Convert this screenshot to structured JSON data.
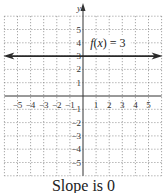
{
  "chart_data": {
    "type": "line",
    "title": "",
    "function_label": "f(x) = 3",
    "xlabel": "",
    "ylabel": "y",
    "xlim": [
      -6,
      6
    ],
    "ylim": [
      -6,
      6
    ],
    "x_ticks": [
      "-5",
      "-4",
      "-3",
      "-2",
      "-1",
      "1",
      "2",
      "3",
      "4",
      "5"
    ],
    "y_ticks": [
      "5",
      "4",
      "3",
      "2",
      "1",
      "-1",
      "-2",
      "-3",
      "-4",
      "-5"
    ],
    "grid": true,
    "series": [
      {
        "name": "f(x) = 3",
        "x": [
          -6,
          6
        ],
        "y": [
          3,
          3
        ],
        "arrows": "both"
      }
    ],
    "caption": "Slope is 0"
  },
  "colors": {
    "axis": "#333333",
    "grid": "#777777",
    "line": "#2a2a2a"
  }
}
